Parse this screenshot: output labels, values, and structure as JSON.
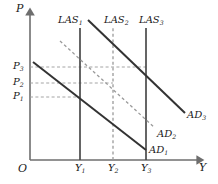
{
  "figure": {
    "type": "economics-diagram"
  },
  "axes": {
    "y_axis_label": "P",
    "x_axis_label": "Y",
    "origin_label": "O"
  },
  "price_levels": [
    {
      "id": "P1",
      "label": "P",
      "sub": "1",
      "y": 97
    },
    {
      "id": "P2",
      "label": "P",
      "sub": "2",
      "y": 83
    },
    {
      "id": "P3",
      "label": "P",
      "sub": "3",
      "y": 67
    }
  ],
  "output_levels": [
    {
      "id": "Y1",
      "label": "Y",
      "sub": "1",
      "x": 80
    },
    {
      "id": "Y2",
      "label": "Y",
      "sub": "2",
      "x": 113
    },
    {
      "id": "Y3",
      "label": "Y",
      "sub": "3",
      "x": 146
    }
  ],
  "las_curves": [
    {
      "id": "LAS1",
      "label": "LAS",
      "sub": "1",
      "style": "solid",
      "x": 80
    },
    {
      "id": "LAS2",
      "label": "LAS",
      "sub": "2",
      "style": "dashed",
      "x": 113
    },
    {
      "id": "LAS3",
      "label": "LAS",
      "sub": "3",
      "style": "solid",
      "x": 146
    }
  ],
  "ad_curves": [
    {
      "id": "AD1",
      "label": "AD",
      "sub": "1",
      "style": "solid",
      "x1": 33,
      "y1": 62,
      "x2": 146,
      "y2": 150
    },
    {
      "id": "AD2",
      "label": "AD",
      "sub": "2",
      "style": "dashed",
      "x1": 60,
      "y1": 41,
      "x2": 155,
      "y2": 128
    },
    {
      "id": "AD3",
      "label": "AD",
      "sub": "3",
      "style": "solid",
      "x1": 88,
      "y1": 20,
      "x2": 185,
      "y2": 113
    }
  ],
  "colors": {
    "ink": "#1a1a1a",
    "axis": "#6e6e6e",
    "solid_curve": "#333333",
    "dashed_curve": "#9a9a9a",
    "guide": "#9a9a9a",
    "background": "#ffffff"
  },
  "labels": {
    "P_axis": "P",
    "Y_axis": "Y",
    "origin": "O",
    "P1": "P",
    "P1_sub": "1",
    "P2": "P",
    "P2_sub": "2",
    "P3": "P",
    "P3_sub": "3",
    "Y1": "Y",
    "Y1_sub": "1",
    "Y2": "Y",
    "Y2_sub": "2",
    "Y3": "Y",
    "Y3_sub": "3",
    "LAS1": "LAS",
    "LAS1_sub": "1",
    "LAS2": "LAS",
    "LAS2_sub": "2",
    "LAS3": "LAS",
    "LAS3_sub": "3",
    "AD1": "AD",
    "AD1_sub": "1",
    "AD2": "AD",
    "AD2_sub": "2",
    "AD3": "AD",
    "AD3_sub": "3"
  }
}
